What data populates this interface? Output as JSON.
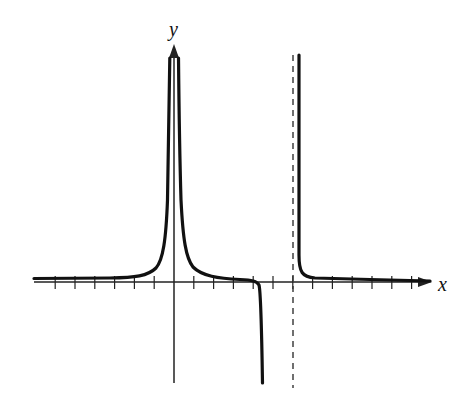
{
  "chart_data": {
    "type": "line",
    "title": "",
    "xlabel": "x",
    "ylabel": "y",
    "grid": false,
    "legend": null,
    "axis_range": {
      "x": [
        -7,
        13
      ],
      "y": [
        -5,
        12
      ]
    },
    "x_ticks": [
      -6,
      -5,
      -4,
      -3,
      -2,
      -1,
      1,
      2,
      3,
      4,
      5,
      6,
      7,
      8,
      9,
      10,
      11,
      12
    ],
    "tick_labels_shown": false,
    "asymptotes": {
      "vertical": [
        {
          "x": 0,
          "style": "none (spike along y-axis, both sides go to +infinity)"
        },
        {
          "x": 6,
          "style": "dashed"
        }
      ],
      "horizontal": [
        {
          "y": 0.15,
          "style": "curve approaches just above x-axis"
        }
      ]
    },
    "series": [
      {
        "name": "left-branch",
        "description": "Flat near y≈0.15 for x<-1, rises steeply to +infinity as x→0-",
        "points": [
          [
            -7,
            0.15
          ],
          [
            -4,
            0.2
          ],
          [
            -2,
            0.35
          ],
          [
            -1,
            0.9
          ],
          [
            -0.5,
            3
          ],
          [
            -0.25,
            11
          ]
        ]
      },
      {
        "name": "middle-branch",
        "description": "Descends from +infinity at x→0+, flattens near y≈0.1, then plunges to -infinity near x≈4.5",
        "points": [
          [
            0.25,
            11
          ],
          [
            0.5,
            3
          ],
          [
            1,
            0.9
          ],
          [
            2,
            0.3
          ],
          [
            3,
            0.15
          ],
          [
            4,
            0.0
          ],
          [
            4.3,
            -0.5
          ],
          [
            4.45,
            -5
          ]
        ]
      },
      {
        "name": "right-branch",
        "description": "Descends from +infinity just right of dashed asymptote x=6, flattens to y≈0.15 approaching x-axis",
        "points": [
          [
            6.3,
            11
          ],
          [
            6.35,
            3
          ],
          [
            6.6,
            0.5
          ],
          [
            8,
            0.25
          ],
          [
            10,
            0.2
          ],
          [
            12.8,
            0.1
          ]
        ]
      }
    ]
  },
  "labels": {
    "x_axis": "x",
    "y_axis": "y"
  }
}
